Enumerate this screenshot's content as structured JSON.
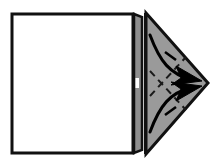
{
  "figure": {
    "type": "origami-instruction-diagram",
    "canvas": {
      "width": 219,
      "height": 164
    },
    "background_color": "#ffffff",
    "stroke_color": "#111111",
    "paper_front_color": "#ffffff",
    "paper_back_color": "#9a9a9a",
    "spine_color": "#8f8f8f",
    "dashed_line_color": "#1a1a1a",
    "arrow_color": "#000000"
  },
  "shapes": {
    "main_sheet": {
      "name": "Square paper body",
      "fill": "#ffffff",
      "stroke": "#111111",
      "stroke_width": 3,
      "points": "12,14 133,14 133,153 12,153"
    },
    "spine_strip": {
      "name": "Folded spine edge strip",
      "fill": "#9a9a9a",
      "stroke": "#111111",
      "stroke_width": 2,
      "points": "134,14 141,17 141,150 134,153"
    },
    "spine_highlight": {
      "name": "Spine crease highlight",
      "fill": "#ffffff",
      "points": "136,78 139,79 139,88 136,88"
    },
    "flap_triangle": {
      "name": "Gray triangular flap",
      "fill": "#9a9a9a",
      "stroke": "#111111",
      "stroke_width": 3,
      "points": "146,13 208,83 146,154"
    },
    "flap_inner_edge": {
      "name": "Triangle vertical inner edge",
      "stroke": "#111111",
      "stroke_width": 3,
      "from": "146,13",
      "to": "146,154"
    }
  },
  "fold_lines": [
    {
      "name": "upper-valley-fold",
      "label": "upper dashed valley crease",
      "style": "dashed",
      "dash_pattern": "7,5",
      "stroke": "#1a1a1a",
      "stroke_width": 2,
      "from": "150,96",
      "to": "186,57"
    },
    {
      "name": "lower-valley-fold",
      "label": "lower dashed valley crease",
      "style": "dashed",
      "dash_pattern": "7,5",
      "stroke": "#1a1a1a",
      "stroke_width": 2,
      "from": "150,71",
      "to": "186,110"
    }
  ],
  "arrows": [
    {
      "name": "upper-fold-arrow",
      "label": "fold top corner down to point",
      "direction": "down-right",
      "path": "M 150,35 C 160,62 170,74 192,80",
      "stroke": "#000000",
      "stroke_width": 3,
      "arrowhead": "192,80",
      "tick": {
        "from": "165,52",
        "to": "176,60"
      }
    },
    {
      "name": "lower-fold-arrow",
      "label": "fold bottom corner up to point",
      "direction": "up-right",
      "path": "M 150,132 C 160,105 170,93 192,87",
      "stroke": "#000000",
      "stroke_width": 3,
      "arrowhead": "192,87",
      "tick": {
        "from": "165,115",
        "to": "176,107"
      }
    }
  ],
  "labels": {
    "caption": "",
    "step_number": ""
  }
}
